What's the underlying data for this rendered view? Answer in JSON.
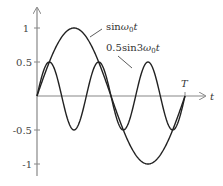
{
  "chart_data": {
    "type": "line",
    "title": "",
    "xlabel": "t",
    "ylabel": "",
    "xlim": [
      0,
      1
    ],
    "ylim": [
      -1,
      1
    ],
    "grid": false,
    "x_ticks": [
      {
        "value": 1,
        "label": "T"
      }
    ],
    "y_ticks": [
      {
        "value": 1,
        "label": "1"
      },
      {
        "value": 0.5,
        "label": "0.5"
      },
      {
        "value": -0.5,
        "label": "-0.5"
      },
      {
        "value": -1,
        "label": "-1"
      }
    ],
    "series": [
      {
        "name": "sinω0t",
        "label_main": "sin",
        "label_omega": "ω",
        "label_sub": "0",
        "label_t": "t",
        "amplitude": 1,
        "harmonic": 1
      },
      {
        "name": "0.5sin3ω0t",
        "label_main": "0.5sin3",
        "label_omega": "ω",
        "label_sub": "0",
        "label_t": "t",
        "amplitude": 0.5,
        "harmonic": 3
      }
    ],
    "annotations": [
      "sinω0t",
      "0.5sin3ω0t",
      "T"
    ]
  },
  "axis": {
    "x_label": "t",
    "period_label": "T"
  },
  "colors": {
    "curve": "#222222",
    "axis": "#888888",
    "text": "#333333"
  }
}
